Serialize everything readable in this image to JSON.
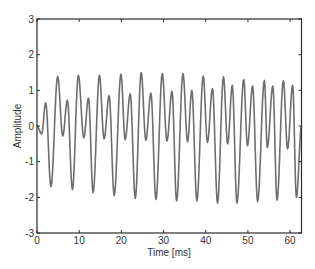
{
  "chart_data": {
    "type": "line",
    "title": "",
    "xlabel": "Time [ms]",
    "ylabel": "Amplitude",
    "xlim": [
      0,
      62.7
    ],
    "ylim": [
      -3,
      3
    ],
    "xticks": [
      0,
      10,
      20,
      30,
      40,
      50,
      60
    ],
    "yticks": [
      -3,
      -2,
      -1,
      0,
      1,
      2,
      3
    ],
    "grid": false,
    "legend": null,
    "line_color": "#6e6e6e",
    "series": [
      {
        "name": "signal",
        "x": [
          0,
          1.1,
          2.07,
          3.3,
          4.9,
          6.1,
          7.2,
          8.4,
          9.8,
          11.1,
          12.2,
          13.3,
          14.8,
          15.9,
          17.1,
          18.3,
          19.9,
          20.9,
          22.1,
          23.3,
          24.7,
          25.8,
          27.0,
          28.2,
          29.7,
          30.8,
          32.0,
          33.1,
          34.6,
          35.7,
          36.7,
          37.9,
          39.4,
          40.4,
          41.6,
          42.8,
          44.2,
          45.2,
          46.3,
          47.4,
          49.0,
          49.9,
          51.1,
          52.3,
          53.9,
          54.6,
          55.9,
          56.9,
          58.4,
          59.4,
          60.6,
          61.5,
          62.7
        ],
        "y": [
          0.0,
          -0.22,
          0.65,
          -1.7,
          1.39,
          -0.28,
          0.72,
          -1.78,
          1.42,
          -0.33,
          0.78,
          -1.87,
          1.42,
          -0.36,
          0.85,
          -1.95,
          1.45,
          -0.38,
          0.9,
          -2.03,
          1.5,
          -0.4,
          0.92,
          -2.06,
          1.47,
          -0.42,
          0.97,
          -2.1,
          1.47,
          -0.44,
          1.0,
          -2.1,
          1.4,
          -0.46,
          1.05,
          -2.16,
          1.38,
          -0.5,
          1.14,
          -2.16,
          1.3,
          -0.55,
          1.12,
          -2.12,
          1.28,
          -0.6,
          1.12,
          -2.08,
          1.27,
          -0.64,
          1.14,
          -2.0,
          0.0
        ]
      }
    ]
  }
}
